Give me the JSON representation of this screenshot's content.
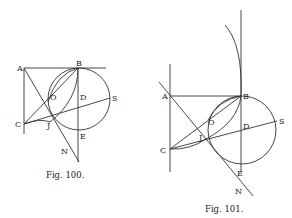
{
  "figures": [
    {
      "id": "fig100",
      "caption": "Fig. 100.",
      "labels": {
        "A": "A",
        "B": "B",
        "C": "C",
        "D": "D",
        "E": "E",
        "N": "N",
        "O": "O",
        "J": "J",
        "S": "S"
      }
    },
    {
      "id": "fig101",
      "caption": "Fig. 101.",
      "labels": {
        "A": "A",
        "B": "B",
        "C": "C",
        "D": "D",
        "E": "E",
        "N": "N",
        "O": "O",
        "J": "J",
        "S": "S"
      }
    }
  ],
  "colors": {
    "ink": "#333333",
    "paper": "#ffffff"
  }
}
